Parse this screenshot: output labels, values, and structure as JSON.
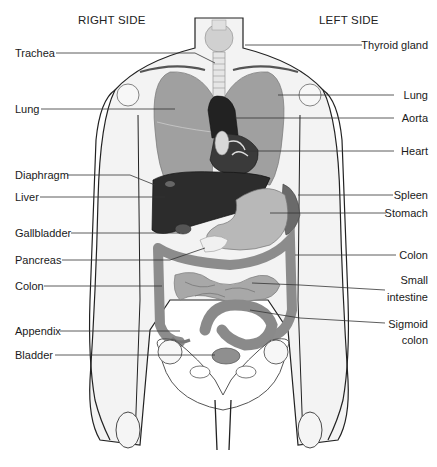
{
  "figure": {
    "side_labels": {
      "right": "RIGHT SIDE",
      "left": "LEFT SIDE"
    },
    "labels_left": [
      {
        "text": "Trachea",
        "y": 53
      },
      {
        "text": "Lung",
        "y": 109
      },
      {
        "text": "Diaphragm",
        "y": 175
      },
      {
        "text": "Liver",
        "y": 197
      },
      {
        "text": "Gallbladder",
        "y": 233
      },
      {
        "text": "Pancreas",
        "y": 260
      },
      {
        "text": "Colon",
        "y": 286
      },
      {
        "text": "Appendix",
        "y": 331
      },
      {
        "text": "Bladder",
        "y": 355
      }
    ],
    "labels_right": [
      {
        "text": "Thyroid gland",
        "y": 45
      },
      {
        "text": "Lung",
        "y": 95
      },
      {
        "text": "Aorta",
        "y": 118
      },
      {
        "text": "Heart",
        "y": 151
      },
      {
        "text": "Spleen",
        "y": 195
      },
      {
        "text": "Stomach",
        "y": 213
      },
      {
        "text": "Colon",
        "y": 255
      },
      {
        "text": "Small",
        "y": 280
      },
      {
        "text": "intestine",
        "y": 297
      },
      {
        "text": "Sigmoid",
        "y": 324
      },
      {
        "text": "colon",
        "y": 340
      }
    ],
    "caption": "",
    "colors": {
      "organ_gray": "#9a9a9a",
      "organ_dark": "#2a2a2a",
      "body_fill": "#f2f2f2",
      "outline": "#222222",
      "leader_line": "#333333"
    }
  }
}
